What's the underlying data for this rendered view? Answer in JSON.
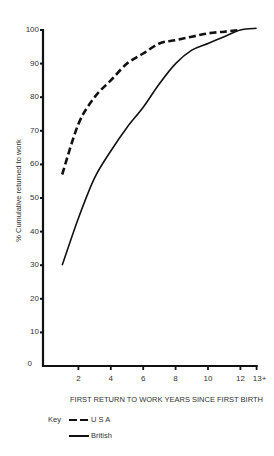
{
  "chart_data": {
    "type": "line",
    "title": "",
    "xlabel": "FIRST RETURN TO WORK YEARS SINCE FIRST BIRTH",
    "ylabel": "% Cumulative returned to work",
    "xlim": [
      0,
      13
    ],
    "ylim": [
      0,
      100
    ],
    "x_ticks": [
      "2",
      "4",
      "6",
      "8",
      "10",
      "12",
      "13+"
    ],
    "y_ticks": [
      "0",
      "10",
      "20",
      "30",
      "40",
      "50",
      "60",
      "70",
      "80",
      "90",
      "100"
    ],
    "grid": false,
    "legend_position": "bottom-left",
    "legend_title": "Key",
    "series": [
      {
        "name": "U S A",
        "style": "dashed",
        "x": [
          1,
          2,
          3,
          4,
          5,
          6,
          7,
          8,
          9,
          10,
          11,
          12
        ],
        "values": [
          57,
          72,
          80,
          85,
          90,
          93,
          96,
          97,
          98,
          99,
          99.5,
          100
        ]
      },
      {
        "name": "British",
        "style": "solid",
        "x": [
          1,
          2,
          3,
          4,
          5,
          6,
          7,
          8,
          9,
          10,
          11,
          12,
          13
        ],
        "values": [
          30,
          44,
          56,
          64,
          71,
          77,
          84,
          90,
          94,
          96,
          98,
          100,
          100.5
        ]
      }
    ]
  },
  "legend": {
    "key_label": "Key",
    "items": [
      {
        "label": "U S A",
        "style": "dashed"
      },
      {
        "label": "British",
        "style": "solid"
      }
    ]
  },
  "colors": {
    "line": "#111111",
    "axis": "#111111",
    "text": "#333333"
  }
}
